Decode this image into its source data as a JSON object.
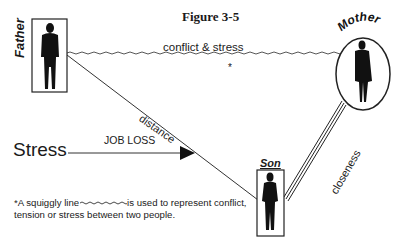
{
  "figure": {
    "title": "Figure 3-5"
  },
  "people": {
    "father": {
      "label": "Father",
      "shape": "rectangle"
    },
    "mother": {
      "label": "Mother",
      "shape": "ellipse"
    },
    "son": {
      "label": "Son",
      "shape": "rectangle"
    }
  },
  "relationships": [
    {
      "from": "Father",
      "to": "Mother",
      "label": "conflict & stress",
      "line_style": "squiggly",
      "marker": "*"
    },
    {
      "from": "Father",
      "to": "Son",
      "label": "distance",
      "line_style": "straight"
    },
    {
      "from": "Son",
      "to": "Mother",
      "label": "closeness",
      "line_style": "triple"
    }
  ],
  "external_stress": {
    "label": "Stress",
    "arrow_label": "JOB LOSS"
  },
  "footnote": {
    "prefix": "*A squiggly line",
    "suffix": "is used to represent conflict, tension or stress between two people."
  },
  "colors": {
    "ink": "#1a1a1a",
    "background": "#ffffff"
  }
}
